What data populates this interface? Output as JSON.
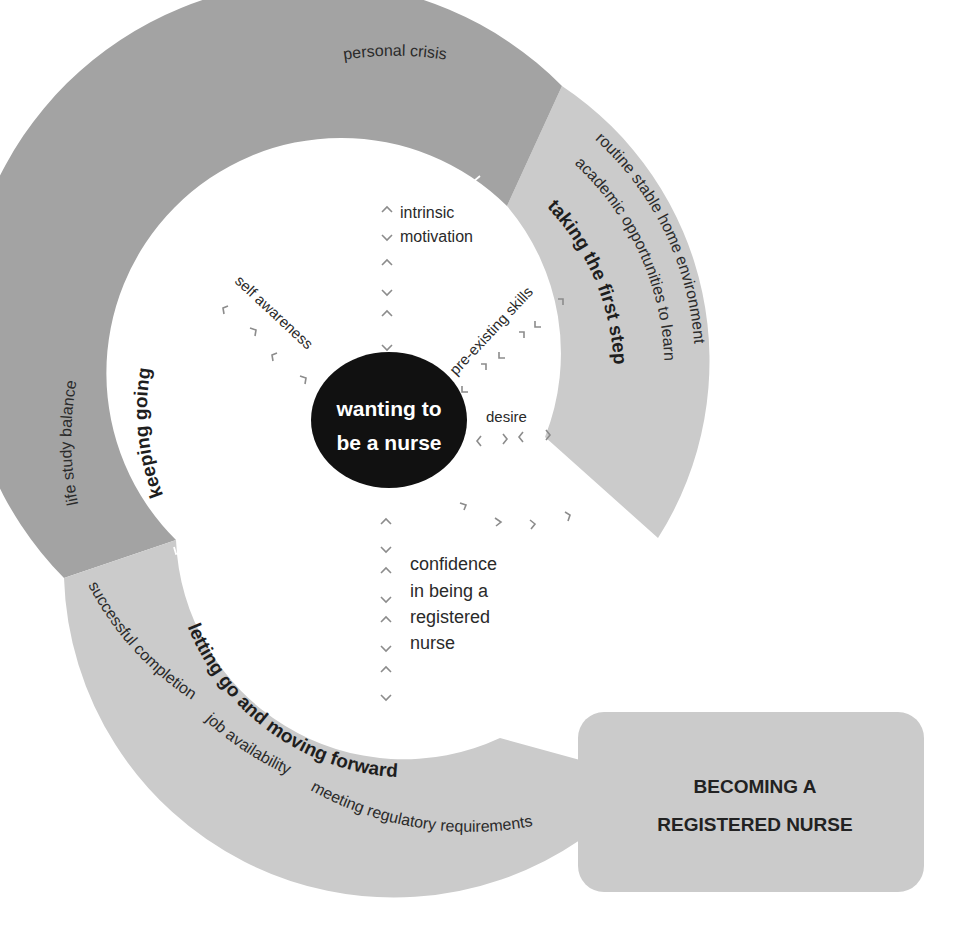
{
  "colors": {
    "dark_segment": "#a3a3a3",
    "light_segment": "#cbcbcb",
    "center_circle": "#111111",
    "chevron_grey": "#8c8c8c"
  },
  "center": {
    "line1": "wanting to",
    "line2": "be a nurse"
  },
  "goal": {
    "line1": "BECOMING A",
    "line2": "REGISTERED NURSE"
  },
  "stages": {
    "taking_first_step": {
      "title": "taking the first step",
      "factors": [
        "routine stable home environment",
        "academic opportunities to learn"
      ]
    },
    "keeping_going": {
      "title": "keeping going",
      "factors": [
        "personal crisis",
        "life study balance"
      ]
    },
    "letting_go": {
      "title": "letting go and moving forward",
      "factors": [
        "successful completion",
        "job availability",
        "meeting regulatory requirements"
      ]
    }
  },
  "spokes": {
    "intrinsic_motivation": {
      "line1": "intrinsic",
      "line2": "motivation"
    },
    "self_awareness": "self awareness",
    "pre_existing_skills": "pre-existing skills",
    "desire": "desire",
    "confidence": [
      "confidence",
      "in being a",
      "registered",
      "nurse"
    ]
  }
}
